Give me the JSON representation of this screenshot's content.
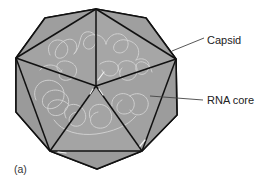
{
  "figure": {
    "panel_label": "(a)",
    "colors": {
      "capsid_fill": "#a0a0a0",
      "edge": "#111111",
      "rna_strand": "#d4d4d4",
      "leader_line": "#444444",
      "background": "#ffffff"
    },
    "labels": [
      {
        "id": "capsid",
        "text": "Capsid"
      },
      {
        "id": "rna_core",
        "text": "RNA core"
      }
    ]
  }
}
